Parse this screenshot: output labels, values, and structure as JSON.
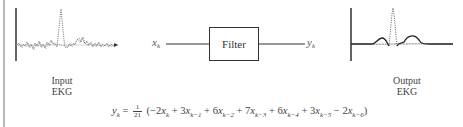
{
  "input_panel": {
    "label_line1": "Input",
    "label_line2": "EKG",
    "signal": "noisy"
  },
  "output_panel": {
    "label_line1": "Output",
    "label_line2": "EKG",
    "signal": "smoothed"
  },
  "block": {
    "input_var": "x",
    "input_sub": "k",
    "box_label": "Filter",
    "output_var": "y",
    "output_sub": "k"
  },
  "equation": {
    "lhs_var": "y",
    "lhs_sub": "k",
    "equals": "=",
    "frac_num": "1",
    "frac_den": "21",
    "terms": [
      {
        "sign": "(−",
        "coef": "2",
        "var": "x",
        "sub": "k"
      },
      {
        "sign": "+",
        "coef": "3",
        "var": "x",
        "sub": "k−1"
      },
      {
        "sign": "+",
        "coef": "6",
        "var": "x",
        "sub": "k−2"
      },
      {
        "sign": "+",
        "coef": "7",
        "var": "x",
        "sub": "k−3"
      },
      {
        "sign": "+",
        "coef": "6",
        "var": "x",
        "sub": "k−4"
      },
      {
        "sign": "+",
        "coef": "3",
        "var": "x",
        "sub": "k−5"
      },
      {
        "sign": "−",
        "coef": "2",
        "var": "x",
        "sub": "k−6"
      }
    ],
    "close": ")"
  },
  "colors": {
    "ink": "#333333",
    "border": "#b9b9b9"
  }
}
